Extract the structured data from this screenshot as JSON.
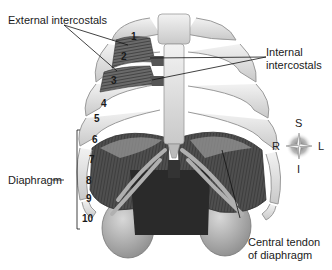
{
  "figure": {
    "labels": {
      "external_intercostals": "External intercostals",
      "internal_intercostals_line1": "Internal",
      "internal_intercostals_line2": "intercostals",
      "diaphragm": "Diaphragm",
      "central_tendon_line1": "Central tendon",
      "central_tendon_line2": "of diaphragm"
    },
    "rib_numbers": [
      "1",
      "2",
      "3",
      "4",
      "5",
      "6",
      "7",
      "8",
      "9",
      "10"
    ],
    "compass": {
      "superior": "S",
      "inferior": "I",
      "right": "R",
      "left": "L"
    }
  }
}
